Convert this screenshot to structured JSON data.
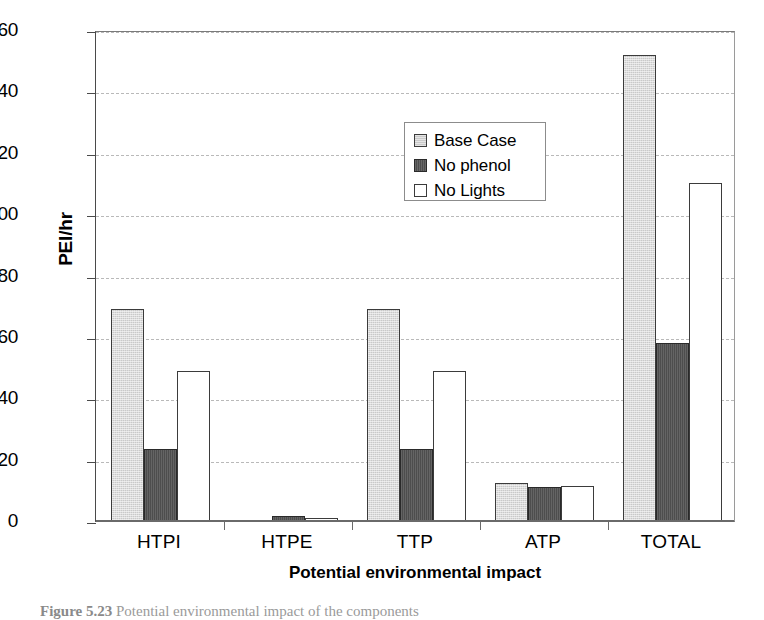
{
  "chart_data": {
    "type": "bar",
    "title": "",
    "xlabel": "Potential environmental impact",
    "ylabel": "PEI/hr",
    "ylim": [
      0,
      160
    ],
    "yticks": [
      0,
      20,
      40,
      60,
      80,
      100,
      120,
      140,
      160
    ],
    "grid": true,
    "legend_position": "upper-center",
    "categories": [
      "HTPI",
      "HTPE",
      "TTP",
      "ATP",
      "TOTAL"
    ],
    "series": [
      {
        "name": "Base Case",
        "color": "#c9c9c9",
        "values": [
          69,
          0,
          69,
          12.5,
          152
        ]
      },
      {
        "name": "No phenol",
        "color": "#4d4d4d",
        "values": [
          23.5,
          1.5,
          23.5,
          11.2,
          58
        ]
      },
      {
        "name": "No Lights",
        "color": "#ffffff",
        "values": [
          49,
          0.7,
          49,
          11.5,
          110
        ]
      }
    ]
  },
  "axis": {
    "y_title": "PEI/hr",
    "x_title": "Potential environmental impact",
    "tick_labels": [
      "160",
      "140",
      "120",
      "100",
      "80",
      "60",
      "40",
      "20",
      "0"
    ]
  },
  "legend": {
    "entries": [
      {
        "label": "Base Case"
      },
      {
        "label": "No phenol"
      },
      {
        "label": "No Lights"
      }
    ]
  },
  "caption": {
    "figure_number": "Figure 5.23",
    "text": "Potential environmental impact of the components"
  }
}
